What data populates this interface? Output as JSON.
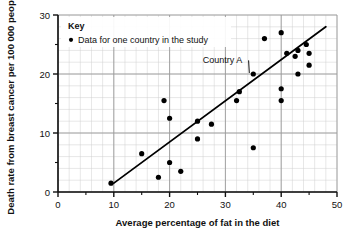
{
  "chart_data": {
    "type": "scatter",
    "title": "",
    "xlabel": "Average percentage of fat in the diet",
    "ylabel": "Death rate from breast cancer per 100 000 people",
    "xlim": [
      0,
      50
    ],
    "ylim": [
      0,
      30
    ],
    "xticks": [
      0,
      10,
      20,
      30,
      40,
      50
    ],
    "yticks": [
      0,
      10,
      20,
      30
    ],
    "x_minor_step": 2,
    "y_minor_step": 2,
    "grid": true,
    "grid_major_color": "#9a9a9a",
    "grid_minor_color": "#cfcfcf",
    "point_color": "#000000",
    "line_color": "#000000",
    "points": [
      {
        "x": 9.5,
        "y": 1.5
      },
      {
        "x": 15.0,
        "y": 6.5
      },
      {
        "x": 18.0,
        "y": 2.5
      },
      {
        "x": 19.0,
        "y": 15.5
      },
      {
        "x": 20.0,
        "y": 5.0
      },
      {
        "x": 20.0,
        "y": 12.5
      },
      {
        "x": 22.0,
        "y": 3.5
      },
      {
        "x": 25.0,
        "y": 9.0
      },
      {
        "x": 25.0,
        "y": 12.0
      },
      {
        "x": 27.5,
        "y": 11.5
      },
      {
        "x": 32.0,
        "y": 15.5
      },
      {
        "x": 32.5,
        "y": 17.0
      },
      {
        "x": 35.0,
        "y": 7.5
      },
      {
        "x": 35.0,
        "y": 20.0
      },
      {
        "x": 37.0,
        "y": 26.0
      },
      {
        "x": 40.0,
        "y": 15.5
      },
      {
        "x": 40.0,
        "y": 17.5
      },
      {
        "x": 40.0,
        "y": 27.0
      },
      {
        "x": 41.0,
        "y": 23.5
      },
      {
        "x": 42.5,
        "y": 23.0
      },
      {
        "x": 43.0,
        "y": 24.0
      },
      {
        "x": 43.0,
        "y": 20.0
      },
      {
        "x": 44.5,
        "y": 25.0
      },
      {
        "x": 45.0,
        "y": 21.5
      },
      {
        "x": 45.0,
        "y": 23.5
      }
    ],
    "trend_line": {
      "x1": 10.0,
      "y1": 1.5,
      "x2": 48.0,
      "y2": 28.0
    },
    "annotations": [
      {
        "label": "Country A",
        "text_x": 29.5,
        "text_y": 21.8,
        "target_x": 35.0,
        "target_y": 20.0
      }
    ],
    "legend": {
      "position": "top-left-inside",
      "title": "Key",
      "entries": [
        {
          "marker": "dot",
          "label": "Data for one country in the study"
        }
      ]
    }
  }
}
